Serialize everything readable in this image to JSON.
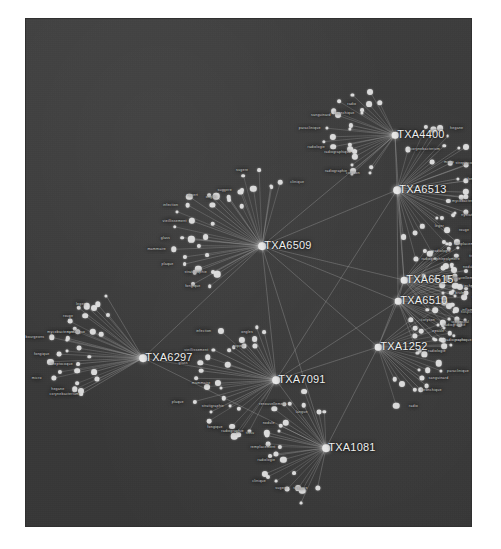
{
  "meta": {
    "background_color": "#3a3a3a",
    "page_background_color": "#ffffff",
    "node_color": "#dcdcdc",
    "edge_color": "#b9b9b9",
    "label_color": "#e6e6e6"
  },
  "chart_data": {
    "type": "graph",
    "layout": "force-directed",
    "grid": false,
    "legend": "none",
    "node_count": 268,
    "hub_count": 9,
    "hubs": [
      {
        "id": "TXA6513",
        "label": "TXA6513",
        "x": 372,
        "y": 172,
        "size": 7
      },
      {
        "id": "TXA4400",
        "label": "TXA4400",
        "x": 370,
        "y": 117,
        "size": 6
      },
      {
        "id": "TXA6509",
        "label": "TXA6509",
        "x": 237,
        "y": 228,
        "size": 7
      },
      {
        "id": "TXA6515",
        "label": "TXA6515",
        "x": 379,
        "y": 262,
        "size": 6
      },
      {
        "id": "TXA6510",
        "label": "TXA6510",
        "x": 373,
        "y": 283,
        "size": 6
      },
      {
        "id": "TXA1252",
        "label": "TXA1252",
        "x": 353,
        "y": 329,
        "size": 6
      },
      {
        "id": "TXA6297",
        "label": "TXA6297",
        "x": 118,
        "y": 340,
        "size": 7
      },
      {
        "id": "TXA7091",
        "label": "TXA7091",
        "x": 251,
        "y": 362,
        "size": 7
      },
      {
        "id": "TXA1081",
        "label": "TXA1081",
        "x": 301,
        "y": 430,
        "size": 7
      }
    ],
    "hub_labels": [
      "TXA6513",
      "TXA4400",
      "TXA6509",
      "TXA6515",
      "TXA6510",
      "TXA1252",
      "TXA6297",
      "TXA7091",
      "TXA1081"
    ],
    "visible_leaf_labels": [
      "cotyson",
      "radiographie",
      "radiographique",
      "radiologie",
      "paraclinique",
      "sanguinard",
      "bronchique",
      "radio",
      "corynebacterium",
      "hegane",
      "micro",
      "streptocoque",
      "fongique",
      "bourgeons",
      "mycobacterium",
      "nystatique",
      "rouge",
      "leger",
      "radiographie",
      "fongique",
      "stratigraphie",
      "plaque",
      "mammaire",
      "glass",
      "vieillissement",
      "infection",
      "expert",
      "ongles",
      "suggere",
      "sugere",
      "clinique",
      "radiologie",
      "remplacement",
      "tissu",
      "nodule",
      "renouvellement",
      "langue",
      "brule",
      "hospitaliers",
      "generic",
      "polymere",
      "serologie",
      "technique",
      "mammaire",
      "inflammation",
      "urogenital",
      "seche",
      "epaule"
    ],
    "clusters": [
      {
        "hub": "TXA4400",
        "position": "top-right",
        "leaf_count": 24
      },
      {
        "hub": "TXA6513",
        "position": "right-upper",
        "leaf_count": 32
      },
      {
        "hub": "TXA6509",
        "position": "center-left",
        "leaf_count": 34
      },
      {
        "hub": "TXA6515",
        "position": "right-mid",
        "leaf_count": 26
      },
      {
        "hub": "TXA6510",
        "position": "right-mid",
        "leaf_count": 24
      },
      {
        "hub": "TXA1252",
        "position": "right-lower",
        "leaf_count": 22
      },
      {
        "hub": "TXA6297",
        "position": "left-lower",
        "leaf_count": 30
      },
      {
        "hub": "TXA7091",
        "position": "center-bottom",
        "leaf_count": 28
      },
      {
        "hub": "TXA1081",
        "position": "bottom-center",
        "leaf_count": 26
      }
    ]
  }
}
